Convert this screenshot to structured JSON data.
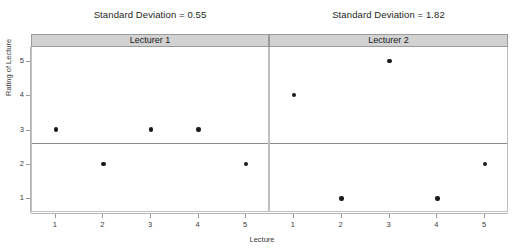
{
  "chart_data": {
    "type": "scatter",
    "title": "",
    "xlabel": "Lecture",
    "ylabel": "Rating of Lecture",
    "x": [
      1,
      2,
      3,
      4,
      5
    ],
    "xlim": [
      0.5,
      5.5
    ],
    "ylim": [
      0.6,
      5.4
    ],
    "yticks": [
      1,
      2,
      3,
      4,
      5
    ],
    "xticks": [
      1,
      2,
      3,
      4,
      5
    ],
    "grid": false,
    "legend_position": "none",
    "panels": [
      {
        "strip_label": "Lecturer 1",
        "title": "Standard Deviation = 0.55",
        "standard_deviation": 0.55,
        "mean": 2.6,
        "values": [
          3,
          2,
          3,
          3,
          2
        ]
      },
      {
        "strip_label": "Lecturer 2",
        "title": "Standard Deviation = 1.82",
        "standard_deviation": 1.82,
        "mean": 2.6,
        "values": [
          4,
          1,
          5,
          1,
          2
        ]
      }
    ],
    "annotations": [
      "Horizontal reference line drawn at the mean rating 2.6 in both panels"
    ]
  },
  "axis": {
    "y_title": "Rating of Lecture",
    "x_title": "Lecture",
    "y_tick_labels": [
      "5",
      "4",
      "3",
      "2",
      "1"
    ],
    "x_tick_labels": [
      "1",
      "2",
      "3",
      "4",
      "5"
    ]
  },
  "colors": {
    "point": "#1a1a1a",
    "strip_background": "#d2d2d2",
    "strip_border": "#9a9a9a",
    "mean_line": "#8a8a8a",
    "axis": "#b5b5b5",
    "text": "#3a3a3a",
    "background": "#ffffff"
  }
}
